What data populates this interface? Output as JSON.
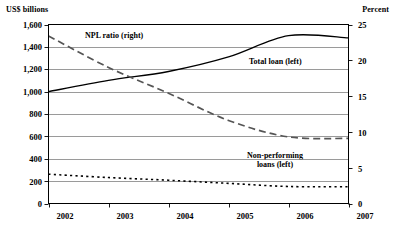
{
  "chart_data": {
    "type": "line",
    "title": "",
    "subtitle": "",
    "xlabel": "",
    "ylabel": "US$ billions",
    "ylabel_right": "Percent",
    "grid": true,
    "legend_position": "inline-annotations",
    "x": [
      2002,
      2003,
      2004,
      2005,
      2006,
      2007
    ],
    "xlim": [
      2002,
      2007
    ],
    "ylim": [
      0,
      1600
    ],
    "ylim_right": [
      0,
      25
    ],
    "ytick_labels": [
      "0",
      "200",
      "400",
      "600",
      "800",
      "1,000",
      "1,200",
      "1,400",
      "1,600"
    ],
    "ytick_values": [
      0,
      200,
      400,
      600,
      800,
      1000,
      1200,
      1400,
      1600
    ],
    "ytick_right_labels": [
      "0",
      "5",
      "10",
      "15",
      "20",
      "25"
    ],
    "ytick_right_values": [
      0,
      5,
      10,
      15,
      20,
      25
    ],
    "xtick_labels": [
      "2002",
      "2003",
      "2004",
      "2005",
      "2006",
      "2007"
    ],
    "series": [
      {
        "name": "Total loan (left)",
        "axis": "left",
        "style": "solid",
        "color": "#000000",
        "values": [
          1000,
          1100,
          1180,
          1310,
          1500,
          1480
        ]
      },
      {
        "name": "NPL ratio (right)",
        "axis": "right",
        "style": "dashed",
        "color": "#555555",
        "values": [
          23.4,
          19.0,
          15.4,
          11.6,
          9.3,
          9.1
        ]
      },
      {
        "name": "Non-performing loans (left)",
        "axis": "left",
        "style": "dotted",
        "color": "#000000",
        "values": [
          262,
          232,
          208,
          180,
          152,
          150
        ]
      }
    ],
    "annotations": [
      {
        "text": "NPL ratio (right)",
        "series": "NPL ratio (right)"
      },
      {
        "text": "Total loan (left)",
        "series": "Total loan (left)"
      },
      {
        "text": "Non-performing",
        "series": "Non-performing loans (left)"
      },
      {
        "text": "loans (left)",
        "series": "Non-performing loans (left)"
      }
    ]
  },
  "axes": {
    "left_title": "US$ billions",
    "right_title": "Percent",
    "left_ticks": [
      "1,600",
      "1,400",
      "1,200",
      "1,000",
      "800",
      "600",
      "400",
      "200",
      "0"
    ],
    "right_ticks": [
      "25",
      "20",
      "15",
      "10",
      "5",
      "0"
    ],
    "x_ticks": [
      "2002",
      "2003",
      "2004",
      "2005",
      "2006",
      "2007"
    ]
  },
  "labels": {
    "npl_ratio": "NPL ratio (right)",
    "total_loan": "Total loan (left)",
    "nonperforming_line1": "Non-performing",
    "nonperforming_line2": "loans (left)"
  },
  "colors": {
    "axis": "#000000",
    "grid": "#808080",
    "solid_series": "#000000",
    "dashed_series": "#555555",
    "dotted_series": "#000000"
  }
}
